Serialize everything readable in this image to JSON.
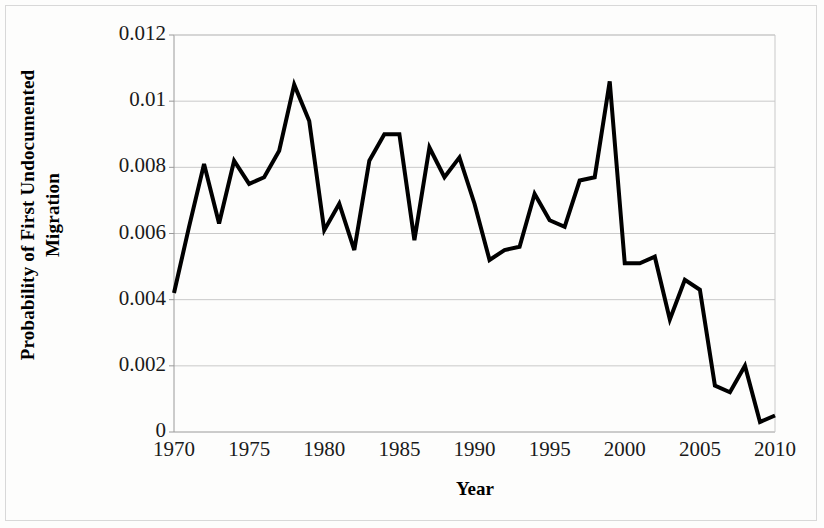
{
  "figure": {
    "axis_titles": {
      "y": "Probability of First Undocumented\nMigration",
      "x": "Year"
    }
  },
  "chart_data": {
    "type": "line",
    "title": "",
    "subtitle": "",
    "xlabel": "Year",
    "ylabel": "Probability of First Undocumented Migration",
    "xlim": [
      1970,
      2010
    ],
    "ylim": [
      0,
      0.012
    ],
    "grid": "horizontal",
    "legend": "none",
    "line_color": "#000000",
    "line_width": 4,
    "xticks": [
      1970,
      1975,
      1980,
      1985,
      1990,
      1995,
      2000,
      2005,
      2010
    ],
    "xtick_labels": [
      "1970",
      "1975",
      "1980",
      "1985",
      "1990",
      "1995",
      "2000",
      "2005",
      "2010"
    ],
    "yticks": [
      0,
      0.002,
      0.004,
      0.006,
      0.008,
      0.01,
      0.012
    ],
    "ytick_labels": [
      "0",
      "0.002",
      "0.004",
      "0.006",
      "0.008",
      "0.01",
      "0.012"
    ],
    "x": [
      1970,
      1971,
      1972,
      1973,
      1974,
      1975,
      1976,
      1977,
      1978,
      1979,
      1980,
      1981,
      1982,
      1983,
      1984,
      1985,
      1986,
      1987,
      1988,
      1989,
      1990,
      1991,
      1992,
      1993,
      1994,
      1995,
      1996,
      1997,
      1998,
      1999,
      2000,
      2001,
      2002,
      2003,
      2004,
      2005,
      2006,
      2007,
      2008,
      2009,
      2010
    ],
    "values": [
      0.0042,
      0.0062,
      0.0081,
      0.0063,
      0.0082,
      0.0075,
      0.0077,
      0.0085,
      0.0105,
      0.0094,
      0.0061,
      0.0069,
      0.0055,
      0.0082,
      0.009,
      0.009,
      0.0058,
      0.0086,
      0.0077,
      0.0083,
      0.0069,
      0.0052,
      0.0055,
      0.0056,
      0.0072,
      0.0064,
      0.0062,
      0.0076,
      0.0077,
      0.0106,
      0.0051,
      0.0051,
      0.0053,
      0.0034,
      0.0046,
      0.0043,
      0.0014,
      0.0012,
      0.002,
      0.0003,
      0.0005
    ],
    "series": [
      {
        "name": "Probability of First Undocumented Migration",
        "values": [
          0.0042,
          0.0062,
          0.0081,
          0.0063,
          0.0082,
          0.0075,
          0.0077,
          0.0085,
          0.0105,
          0.0094,
          0.0061,
          0.0069,
          0.0055,
          0.0082,
          0.009,
          0.009,
          0.0058,
          0.0086,
          0.0077,
          0.0083,
          0.0069,
          0.0052,
          0.0055,
          0.0056,
          0.0072,
          0.0064,
          0.0062,
          0.0076,
          0.0077,
          0.0106,
          0.0051,
          0.0051,
          0.0053,
          0.0034,
          0.0046,
          0.0043,
          0.0014,
          0.0012,
          0.002,
          0.0003,
          0.0005
        ]
      }
    ]
  }
}
